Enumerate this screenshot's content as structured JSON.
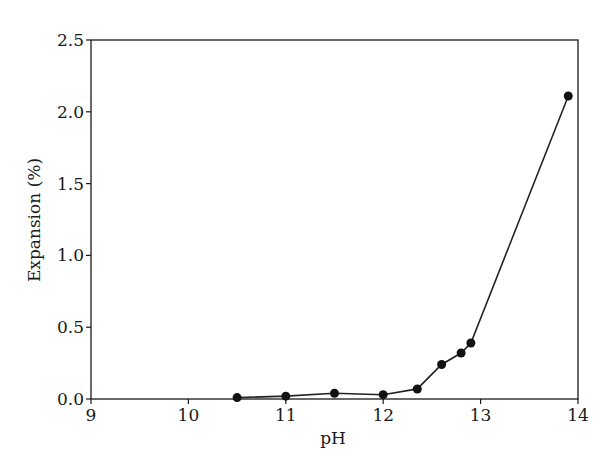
{
  "chart_data": {
    "type": "line",
    "title": "",
    "xlabel": "pH",
    "ylabel": "Expansion (%)",
    "xlim": [
      9,
      14
    ],
    "ylim": [
      0.0,
      2.5
    ],
    "xticks": [
      9,
      10,
      11,
      12,
      13,
      14
    ],
    "xtick_labels": [
      "9",
      "10",
      "11",
      "12",
      "13",
      "14"
    ],
    "yticks": [
      0.0,
      0.5,
      1.0,
      1.5,
      2.0,
      2.5
    ],
    "ytick_labels": [
      "0.0",
      "0.5",
      "1.0",
      "1.5",
      "2.0",
      "2.5"
    ],
    "grid": false,
    "legend": null,
    "series": [
      {
        "name": "Expansion",
        "marker": "filled-circle",
        "color": "#111111",
        "x": [
          10.5,
          11.0,
          11.5,
          12.0,
          12.35,
          12.6,
          12.8,
          12.9,
          13.9
        ],
        "y": [
          0.01,
          0.02,
          0.04,
          0.03,
          0.07,
          0.24,
          0.32,
          0.39,
          2.11
        ]
      }
    ]
  },
  "style": {
    "axis_color": "#1a1a1a",
    "line_color": "#222222",
    "marker_color": "#111111",
    "background": "#ffffff"
  }
}
